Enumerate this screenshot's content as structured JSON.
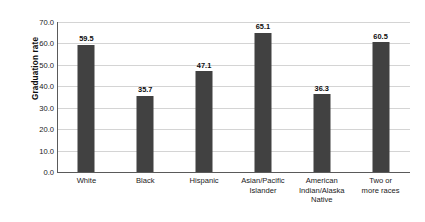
{
  "chart_data": {
    "type": "bar",
    "title": "",
    "subtitle": "",
    "xlabel": "",
    "ylabel": "Graduation rate",
    "ylim": [
      0.0,
      70.0
    ],
    "ytick_labels": [
      "70.0",
      "60.0",
      "50.0",
      "40.0",
      "30.0",
      "20.0",
      "10.0",
      "0.0"
    ],
    "ytick_values": [
      70.0,
      60.0,
      50.0,
      40.0,
      30.0,
      20.0,
      10.0,
      0.0
    ],
    "grid": true,
    "legend": false,
    "legend_position": "none",
    "bar_color": "#414141",
    "gridline_color": "#d4d4d4",
    "axis_color": "#5a5a5a",
    "categories": [
      "White",
      "Black",
      "Hispanic",
      "Asian/Pacific Islander",
      "American Indian/Alaska Native",
      "Two or more races"
    ],
    "category_lines": [
      [
        "White"
      ],
      [
        "Black"
      ],
      [
        "Hispanic"
      ],
      [
        "Asian/Pacific",
        "Islander"
      ],
      [
        "American",
        "Indian/Alaska",
        "Native"
      ],
      [
        "Two or",
        "more races"
      ]
    ],
    "values": [
      59.5,
      35.7,
      47.1,
      65.1,
      36.3,
      60.5
    ],
    "value_labels": [
      "59.5",
      "35.7",
      "47.1",
      "65.1",
      "36.3",
      "60.5"
    ]
  }
}
